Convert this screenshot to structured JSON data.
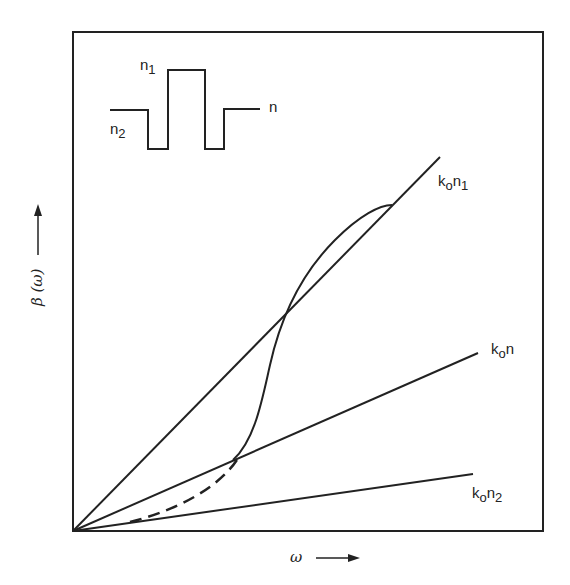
{
  "diagram": {
    "axes": {
      "x_label": "ω",
      "y_label": "β (ω)"
    },
    "inset": {
      "description": "W-type refractive index profile",
      "labels": {
        "core": "n",
        "core_sub": "1",
        "depressed": "n",
        "depressed_sub": "2",
        "cladding": "n"
      }
    },
    "lines": [
      {
        "id": "k0n1",
        "label_base": "k",
        "label_sub": "o",
        "label_n": "n",
        "label_nsub": "1",
        "from": [
          73,
          531
        ],
        "to": [
          440,
          157
        ]
      },
      {
        "id": "k0n",
        "label_base": "k",
        "label_sub": "o",
        "label_n": "n",
        "label_nsub": "",
        "from": [
          73,
          531
        ],
        "to": [
          478,
          353
        ]
      },
      {
        "id": "k0n2",
        "label_base": "k",
        "label_sub": "o",
        "label_n": "n",
        "label_nsub": "2",
        "from": [
          73,
          531
        ],
        "to": [
          473,
          474
        ]
      }
    ],
    "colors": {
      "ink": "#222222",
      "background": "#ffffff"
    }
  }
}
